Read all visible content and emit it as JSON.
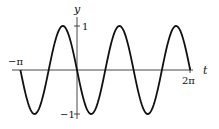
{
  "chart_data": {
    "type": "line",
    "title": "",
    "xlabel": "t",
    "ylabel": "y",
    "function": "y = -sin(2t)",
    "xlim": [
      -3.14159,
      6.28318
    ],
    "ylim": [
      -1,
      1
    ],
    "x_ticks": [
      {
        "value": -3.14159,
        "label": "−π"
      },
      {
        "value": 6.28318,
        "label": "2π"
      }
    ],
    "y_ticks": [
      {
        "value": 1,
        "label": "1"
      },
      {
        "value": -1,
        "label": "−1"
      }
    ],
    "grid": false,
    "legend": null,
    "series": [
      {
        "name": "y(t)",
        "color": "#111111",
        "x_range": [
          -3.14159,
          6.28318
        ],
        "samples": 200
      }
    ]
  },
  "axes": {
    "x_label": "t",
    "y_label": "y",
    "x_tick_left": "−π",
    "x_tick_right": "2π",
    "y_tick_top": "1",
    "y_tick_bottom": "−1"
  }
}
